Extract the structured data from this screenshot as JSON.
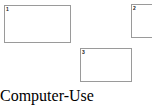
{
  "canvas": {
    "width": 152,
    "height": 87,
    "background_color": "#ffffff"
  },
  "style": {
    "box_border_color": "#9a9a9a",
    "box_fill_color": "#ffffff",
    "label_color": "#1a1a1a"
  },
  "boxes": [
    {
      "label": "1",
      "name": "bounding-box-1",
      "x": 4,
      "y": 5,
      "width": 67,
      "height": 38,
      "clipped": false
    },
    {
      "label": "2",
      "name": "bounding-box-2",
      "x": 131,
      "y": 4,
      "width": 28,
      "height": 34,
      "clipped": true
    },
    {
      "label": "3",
      "name": "bounding-box-3",
      "x": 80,
      "y": 48,
      "width": 52,
      "height": 34,
      "clipped": false
    }
  ]
}
